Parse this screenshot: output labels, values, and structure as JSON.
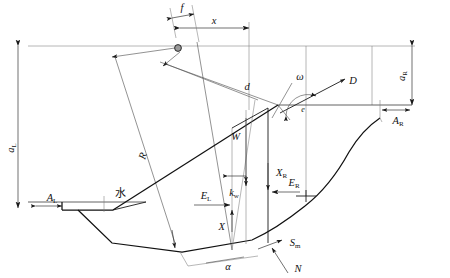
{
  "figure": {
    "type": "engineering-cross-section-diagram",
    "width": 450,
    "height": 278,
    "background_color": "#ffffff",
    "line_color": "#1a1a1a"
  },
  "labels": {
    "f": "f",
    "x": "x",
    "d": "d",
    "omega": "ω",
    "D": "D",
    "a_R_base": "a",
    "a_R_sub": "R",
    "A_R_base": "A",
    "A_R_sub": "R",
    "e": "e",
    "a_L_base": "a",
    "a_L_sub": "L",
    "A_L_base": "A",
    "A_L_sub": "L",
    "R": "R",
    "W": "W",
    "X_R_base": "X",
    "X_R_sub": "R",
    "k_w_base": "k",
    "k_w_sub": "w",
    "E_L_base": "E",
    "E_L_sub": "L",
    "E_R_base": "E",
    "E_R_sub": "R",
    "X": "X",
    "S_m_base": "S",
    "S_m_sub": "m",
    "N": "N",
    "alpha": "α",
    "water_cjk": "水"
  },
  "geometry_notes": {
    "crest_level_y": 46,
    "right_bench_y": 105,
    "water_surface_y": 202,
    "pivot_point": [
      178,
      48
    ],
    "slice_left_x": 232,
    "slice_right_x": 268
  }
}
